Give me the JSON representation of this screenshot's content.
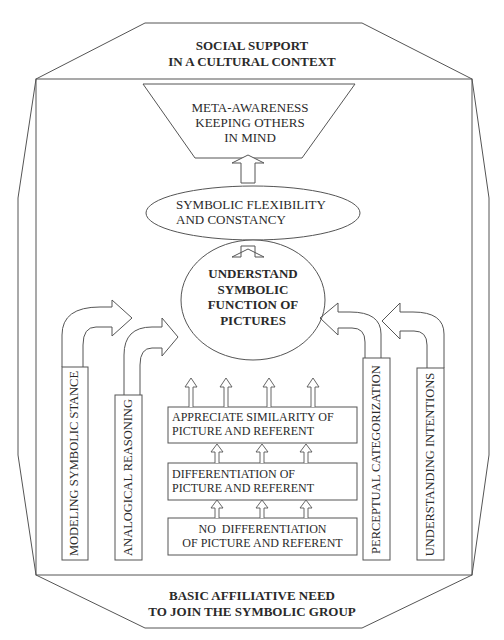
{
  "diagram": {
    "outer_top_label": [
      "SOCIAL SUPPORT",
      "IN A CULTURAL CONTEXT"
    ],
    "outer_bottom_label": [
      "BASIC AFFILIATIVE NEED",
      "TO JOIN THE SYMBOLIC GROUP"
    ],
    "top_trapezoid": [
      "META-AWARENESS",
      "KEEPING OTHERS",
      "IN MIND"
    ],
    "flexibility_ellipse": [
      "SYMBOLIC FLEXIBILITY",
      "AND CONSTANCY"
    ],
    "core_ellipse": [
      "UNDERSTAND",
      "SYMBOLIC",
      "FUNCTION OF",
      "PICTURES"
    ],
    "stages": [
      {
        "lines": [
          "APPRECIATE SIMILARITY OF",
          "PICTURE AND REFERENT"
        ]
      },
      {
        "lines": [
          "DIFFERENTIATION OF",
          "PICTURE AND REFERENT"
        ]
      },
      {
        "lines": [
          "NO  DIFFERENTIATION",
          "OF PICTURE AND REFERENT"
        ]
      }
    ],
    "side_factors": {
      "left": [
        "MODELING SYMBOLIC STANCE",
        "ANALOGICAL REASONING"
      ],
      "right": [
        "PERCEPTUAL CATEGORIZATION",
        "UNDERSTANDING INTENTIONS"
      ]
    },
    "colors": {
      "stroke": "#555555",
      "text": "#2a2a2a",
      "background": "#ffffff"
    }
  }
}
